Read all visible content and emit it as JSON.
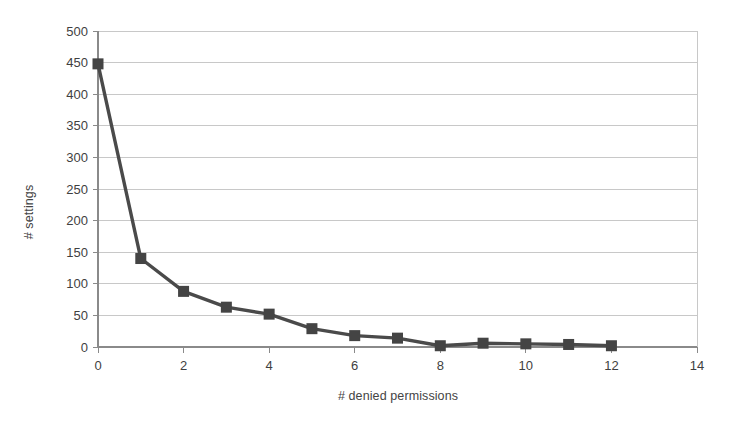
{
  "chart_data": {
    "type": "line",
    "title": "",
    "xlabel": "# denied permissions",
    "ylabel": "# settings",
    "x": [
      0,
      1,
      2,
      3,
      4,
      5,
      6,
      7,
      8,
      9,
      10,
      11,
      12
    ],
    "values": [
      448,
      140,
      88,
      63,
      52,
      29,
      18,
      14,
      2,
      6,
      5,
      4,
      2
    ],
    "series": [
      {
        "name": "# settings",
        "values": [
          448,
          140,
          88,
          63,
          52,
          29,
          18,
          14,
          2,
          6,
          5,
          4,
          2
        ]
      }
    ],
    "xlim": [
      0,
      14
    ],
    "ylim": [
      0,
      500
    ],
    "xticks": [
      0,
      2,
      4,
      6,
      8,
      10,
      12,
      14
    ],
    "yticks": [
      0,
      50,
      100,
      150,
      200,
      250,
      300,
      350,
      400,
      450,
      500
    ],
    "xtick_labels": [
      "0",
      "2",
      "4",
      "6",
      "8",
      "10",
      "12",
      "14"
    ],
    "ytick_labels": [
      "0",
      "50",
      "100",
      "150",
      "200",
      "250",
      "300",
      "350",
      "400",
      "450",
      "500"
    ],
    "grid": "horizontal",
    "legend": "none",
    "marker": "square",
    "colors": {
      "line": "#4a4a4a",
      "marker": "#444444",
      "grid": "#c8c8c8",
      "axis": "#8a8a8a",
      "background": "#ffffff",
      "text": "#3f3f3f"
    }
  }
}
